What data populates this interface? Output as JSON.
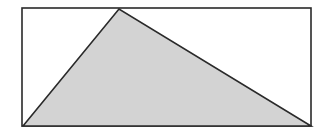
{
  "diagram": {
    "type": "geometry",
    "rectangle": {
      "x1": 22,
      "y1": 8,
      "x2": 311,
      "y2": 126
    },
    "triangle": {
      "points": [
        [
          23,
          126
        ],
        [
          119,
          9
        ],
        [
          311,
          126
        ]
      ]
    },
    "colors": {
      "stroke": "#2a2a2a",
      "fill": "#d3d3d3",
      "background": "#ffffff"
    }
  }
}
